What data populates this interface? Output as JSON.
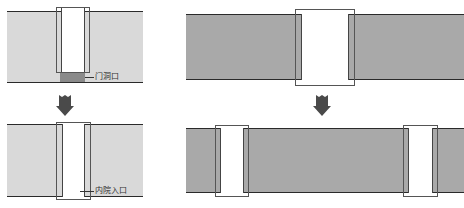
{
  "diagram": {
    "type": "architectural-transformation",
    "left": {
      "before": {
        "band_color": "#d9d9d9",
        "label": "门洞口"
      },
      "after": {
        "band_color": "#d9d9d9",
        "label": "内院入口"
      }
    },
    "right": {
      "before": {
        "band_color": "#a9a9a9",
        "door_count": 1
      },
      "after": {
        "band_color": "#a9a9a9",
        "door_count": 2
      }
    },
    "arrow_color": "#4a4a4a",
    "opening_color": "#8a8a8a"
  }
}
